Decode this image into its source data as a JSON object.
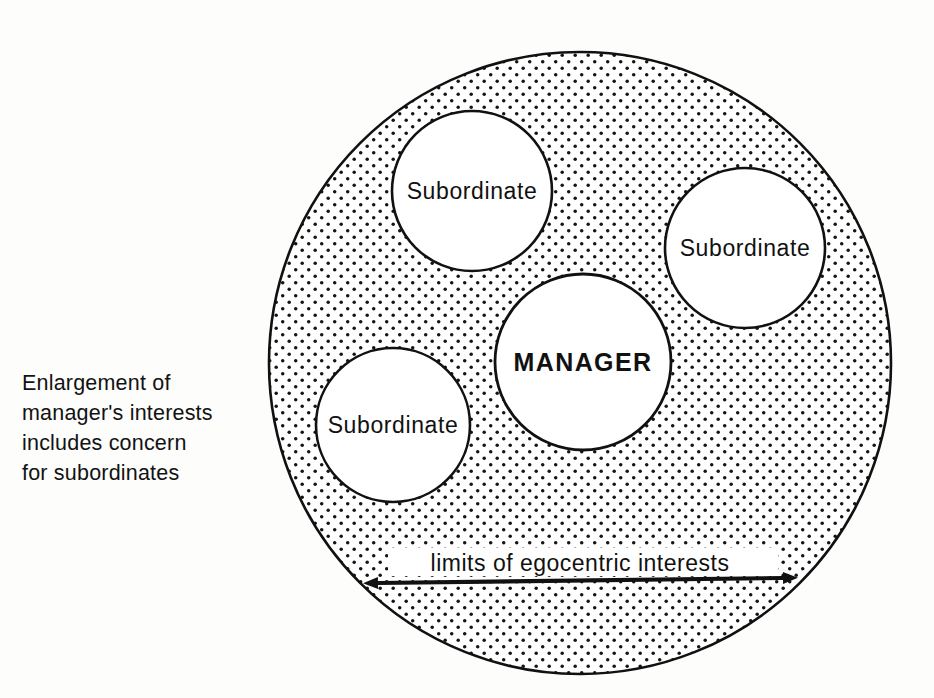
{
  "figure": {
    "title": "Enlargement of manager's interests includes concern for subordinates",
    "caption_lines": [
      "Enlargement of",
      "manager's interests",
      "includes concern",
      "for subordinates"
    ],
    "colors": {
      "ink": "#111111",
      "paper": "#fdfdfc",
      "fill_white": "#ffffff",
      "stipple_dot": "#111111"
    }
  },
  "diagram": {
    "type": "venn-circles",
    "outer_region": {
      "name": "egocentric-interests-region",
      "fill": "stipple-dots",
      "cx": 580,
      "cy": 363,
      "r": 311
    },
    "nodes": [
      {
        "id": "subordinate-top",
        "label": "Subordinate",
        "cx": 472,
        "cy": 191,
        "r": 80,
        "emphasis": "normal"
      },
      {
        "id": "subordinate-right",
        "label": "Subordinate",
        "cx": 745,
        "cy": 248,
        "r": 80,
        "emphasis": "normal"
      },
      {
        "id": "subordinate-left",
        "label": "Subordinate",
        "cx": 393,
        "cy": 425,
        "r": 77,
        "emphasis": "normal"
      },
      {
        "id": "manager",
        "label": "MANAGER",
        "cx": 583,
        "cy": 362,
        "r": 88,
        "emphasis": "bold"
      }
    ],
    "annotation": {
      "id": "egocentric-limits",
      "label": "limits of egocentric interests",
      "arrow": {
        "type": "double-headed",
        "x1": 378,
        "x2": 783,
        "y1": 583,
        "y2": 578
      },
      "label_x": 580,
      "label_y": 563
    }
  }
}
